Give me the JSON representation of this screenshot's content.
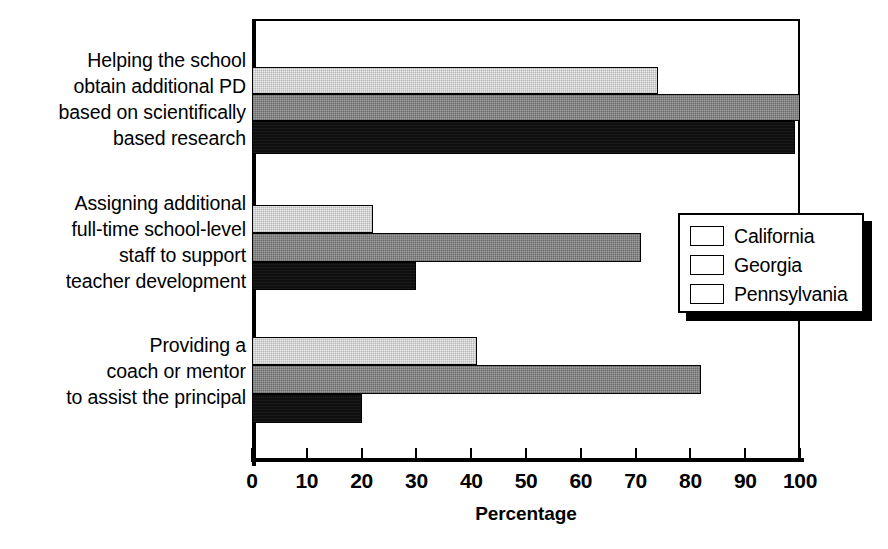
{
  "chart_data": {
    "type": "bar",
    "orientation": "horizontal",
    "title": "",
    "xlabel": "Percentage",
    "ylabel": "",
    "xlim": [
      0,
      100
    ],
    "xticks": [
      "0",
      "10",
      "20",
      "30",
      "40",
      "50",
      "60",
      "70",
      "80",
      "90",
      "100"
    ],
    "grid": false,
    "legend_position": "middle-right",
    "categories": [
      "Helping the school\nobtain additional PD\nbased on scientifically\nbased research",
      "Assigning additional\nfull-time school-level\nstaff to support\nteacher development",
      "Providing a\ncoach or mentor\nto assist the principal"
    ],
    "series": [
      {
        "name": "California",
        "color": "#e9e9e9",
        "values": [
          74,
          22,
          41
        ]
      },
      {
        "name": "Georgia",
        "color": "#9d9d9d",
        "values": [
          100,
          71,
          82
        ]
      },
      {
        "name": "Pennsylvania",
        "color": "#100f0f",
        "values": [
          99,
          30,
          20
        ]
      }
    ]
  },
  "legend": {
    "items": [
      {
        "label": "California",
        "swatch": "swatch-california"
      },
      {
        "label": "Georgia",
        "swatch": "swatch-georgia"
      },
      {
        "label": "Pennsylvania",
        "swatch": "swatch-pennsylvania"
      }
    ]
  }
}
